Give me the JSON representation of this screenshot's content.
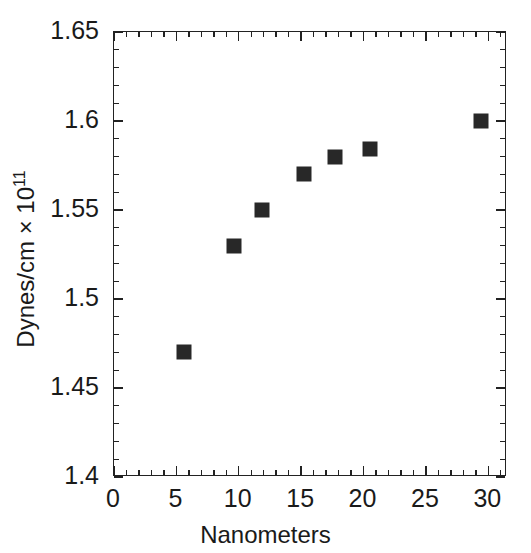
{
  "chart_data": {
    "type": "scatter",
    "title": "",
    "xlabel": "Nanometers",
    "ylabel": "Dynes/cm × 10",
    "ylabel_exponent": "11",
    "xlim": [
      0,
      31.5
    ],
    "ylim": [
      1.4,
      1.65
    ],
    "xticks": [
      0,
      5,
      10,
      15,
      20,
      25,
      30
    ],
    "xtick_labels": [
      "0",
      "5",
      "10",
      "15",
      "20",
      "25",
      "30"
    ],
    "yticks": [
      1.4,
      1.45,
      1.5,
      1.55,
      1.6,
      1.65
    ],
    "ytick_labels": [
      "1.4",
      "1.45",
      "1.5",
      "1.55",
      "1.6",
      "1.65"
    ],
    "x_minor_tick_interval": 1,
    "y_minor_tick_interval": 0.01,
    "grid": false,
    "legend": null,
    "marker_style": "filled-square",
    "marker_color": "#282828",
    "frame_color": "#222222",
    "background": "#ffffff",
    "x": [
      5.6,
      9.6,
      11.9,
      15.2,
      17.7,
      20.5,
      29.4
    ],
    "y": [
      1.47,
      1.53,
      1.55,
      1.57,
      1.58,
      1.584,
      1.6
    ],
    "points": [
      {
        "x": 5.6,
        "y": 1.47
      },
      {
        "x": 9.6,
        "y": 1.53
      },
      {
        "x": 11.9,
        "y": 1.55
      },
      {
        "x": 15.2,
        "y": 1.57
      },
      {
        "x": 17.7,
        "y": 1.58
      },
      {
        "x": 20.5,
        "y": 1.584
      },
      {
        "x": 29.4,
        "y": 1.6
      }
    ]
  }
}
